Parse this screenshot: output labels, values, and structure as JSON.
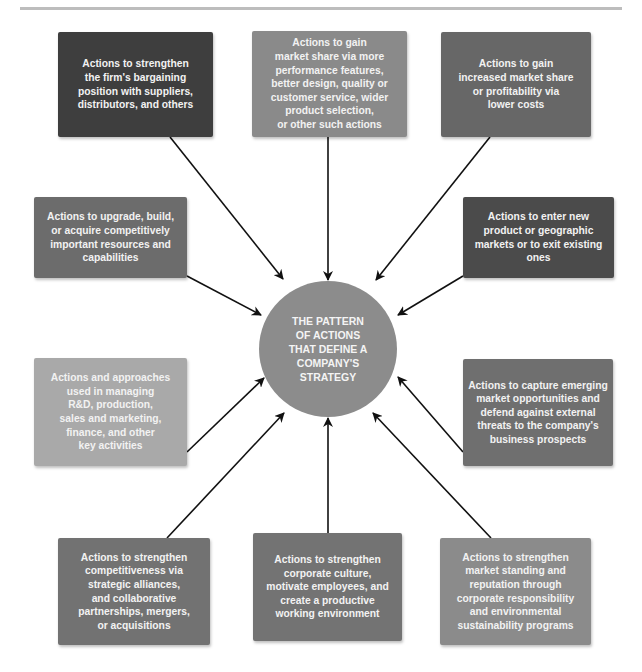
{
  "diagram": {
    "center": {
      "label": "THE PATTERN\nOF ACTIONS\nTHAT DEFINE A\nCOMPANY'S\nSTRATEGY",
      "color": "#8c8c8c"
    },
    "nodes": [
      {
        "id": "bargaining",
        "label": "Actions to strengthen\nthe firm's bargaining\nposition with suppliers,\ndistributors, and others",
        "color": "#3e3e3e"
      },
      {
        "id": "differentiation",
        "label": "Actions to gain\nmarket share via more\nperformance features,\nbetter design, quality or\ncustomer service, wider\nproduct selection,\nor other such actions",
        "color": "#8a8a8a"
      },
      {
        "id": "low-cost",
        "label": "Actions to gain\nincreased market share\nor profitability via\nlower costs",
        "color": "#676767"
      },
      {
        "id": "resources",
        "label": "Actions to upgrade, build,\nor acquire competitively\nimportant resources and\ncapabilities",
        "color": "#6c6c6c"
      },
      {
        "id": "markets",
        "label": "Actions to enter new\nproduct or geographic\nmarkets or to exit existing\nones",
        "color": "#4b4b4b"
      },
      {
        "id": "functional",
        "label": "Actions and approaches\nused in managing\nR&D, production,\nsales and marketing,\nfinance, and other\nkey activities",
        "color": "#a9a9a9"
      },
      {
        "id": "opportunities",
        "label": "Actions to capture emerging\nmarket opportunities and\ndefend against external\nthreats to the company's\nbusiness prospects",
        "color": "#6f6f6f"
      },
      {
        "id": "alliances",
        "label": "Actions to strengthen\ncompetitiveness via\nstrategic alliances,\nand collaborative\npartnerships, mergers,\nor acquisitions",
        "color": "#727272"
      },
      {
        "id": "culture",
        "label": "Actions to strengthen\ncorporate culture,\nmotivate employees, and\ncreate a productive\nworking environment",
        "color": "#737373"
      },
      {
        "id": "reputation",
        "label": "Actions to strengthen\nmarket standing and\nreputation through\ncorporate responsibility\nand environmental\nsustainability programs",
        "color": "#8b8b8b"
      }
    ]
  }
}
